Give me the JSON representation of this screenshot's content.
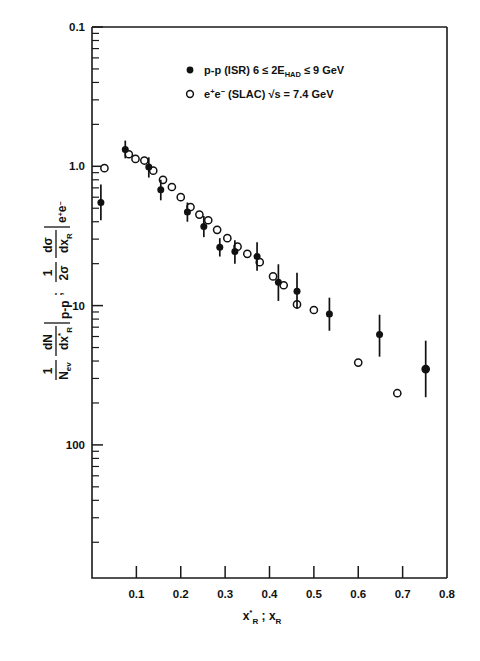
{
  "figure": {
    "background": "#ffffff",
    "ink_color": "#111111"
  },
  "chart_data": {
    "type": "scatter",
    "title": "",
    "xlabel": "x*R ; xR",
    "ylabel": "1/Nev dN/dx*R |p-p ; 1/2sigma dsigma/dxR |e+e-",
    "xscale": "linear",
    "yscale": "log",
    "xlim": [
      0.0,
      0.8
    ],
    "ylim": [
      0.1,
      100
    ],
    "xticks": [
      0.1,
      0.2,
      0.3,
      0.4,
      0.5,
      0.6,
      0.7,
      0.8
    ],
    "xticklabels": [
      "0.1",
      "0.2",
      "0.3",
      "0.4",
      "0.5",
      "0.6",
      "0.7",
      "0.8"
    ],
    "yticks": [
      0.1,
      1.0,
      10,
      100
    ],
    "yticklabels": [
      "0.1",
      "1.0",
      "10",
      "100"
    ],
    "grid": false,
    "legend_position": "top-center",
    "series": [
      {
        "name": "p-p (ISR)  6 <= 2E_HAD <= 9 GeV",
        "marker": "filled-circle",
        "points": [
          {
            "x": 0.02,
            "y": 5.5,
            "yerr_lo": 4.1,
            "yerr_hi": 7.4
          },
          {
            "x": 0.075,
            "y": 13.2,
            "yerr_lo": 11.4,
            "yerr_hi": 15.3
          },
          {
            "x": 0.128,
            "y": 9.9,
            "yerr_lo": 8.3,
            "yerr_hi": 11.6
          },
          {
            "x": 0.155,
            "y": 6.8,
            "yerr_lo": 5.7,
            "yerr_hi": 8.0
          },
          {
            "x": 0.215,
            "y": 4.7,
            "yerr_lo": 4.0,
            "yerr_hi": 5.5
          },
          {
            "x": 0.252,
            "y": 3.7,
            "yerr_lo": 3.1,
            "yerr_hi": 4.4
          },
          {
            "x": 0.288,
            "y": 2.62,
            "yerr_lo": 2.25,
            "yerr_hi": 3.05
          },
          {
            "x": 0.322,
            "y": 2.45,
            "yerr_lo": 2.0,
            "yerr_hi": 2.95
          },
          {
            "x": 0.372,
            "y": 2.25,
            "yerr_lo": 1.78,
            "yerr_hi": 2.85
          },
          {
            "x": 0.42,
            "y": 1.47,
            "yerr_lo": 1.08,
            "yerr_hi": 1.98
          },
          {
            "x": 0.462,
            "y": 1.27,
            "yerr_lo": 0.95,
            "yerr_hi": 1.72
          },
          {
            "x": 0.535,
            "y": 0.87,
            "yerr_lo": 0.66,
            "yerr_hi": 1.14
          },
          {
            "x": 0.648,
            "y": 0.62,
            "yerr_lo": 0.43,
            "yerr_hi": 0.86
          },
          {
            "x": 0.752,
            "y": 0.35,
            "yerr_lo": 0.22,
            "yerr_hi": 0.56
          }
        ]
      },
      {
        "name": "e+e- (SLAC)  sqrt(s) = 7.4 GeV",
        "marker": "open-circle",
        "points": [
          {
            "x": 0.028,
            "y": 9.7
          },
          {
            "x": 0.083,
            "y": 12.2
          },
          {
            "x": 0.098,
            "y": 11.3
          },
          {
            "x": 0.118,
            "y": 11.0
          },
          {
            "x": 0.138,
            "y": 9.3
          },
          {
            "x": 0.16,
            "y": 8.0
          },
          {
            "x": 0.18,
            "y": 7.1
          },
          {
            "x": 0.2,
            "y": 6.0
          },
          {
            "x": 0.222,
            "y": 5.1
          },
          {
            "x": 0.242,
            "y": 4.5
          },
          {
            "x": 0.262,
            "y": 4.1
          },
          {
            "x": 0.282,
            "y": 3.5
          },
          {
            "x": 0.305,
            "y": 3.05
          },
          {
            "x": 0.328,
            "y": 2.65
          },
          {
            "x": 0.35,
            "y": 2.35
          },
          {
            "x": 0.378,
            "y": 2.05
          },
          {
            "x": 0.408,
            "y": 1.62
          },
          {
            "x": 0.432,
            "y": 1.4
          },
          {
            "x": 0.462,
            "y": 1.02
          },
          {
            "x": 0.5,
            "y": 0.93
          },
          {
            "x": 0.6,
            "y": 0.39
          },
          {
            "x": 0.688,
            "y": 0.235
          },
          {
            "x": 0.752,
            "y": 0.35
          }
        ]
      }
    ]
  },
  "legend": {
    "entry1": {
      "marker": "filled-circle",
      "label_main": "p-p  (ISR)",
      "label_cond_pre": "6 ≤ 2E",
      "label_cond_sub": "HAD",
      "label_cond_post": "≤ 9 GeV"
    },
    "entry2": {
      "marker": "open-circle",
      "label_main_a": "e",
      "label_main_a_sup": "+",
      "label_main_b": "e",
      "label_main_b_sup": "−",
      "label_main_c": "(SLAC)",
      "label_cond": "√s = 7.4 GeV"
    }
  },
  "axes": {
    "x": {
      "title_part1": "x",
      "title_part1_sup": "*",
      "title_part1_sub": "R",
      "title_sep": ";",
      "title_part2": "x",
      "title_part2_sub": "R",
      "ticklabels": [
        "0.1",
        "0.2",
        "0.3",
        "0.4",
        "0.5",
        "0.6",
        "0.7",
        "0.8"
      ]
    },
    "y": {
      "ticklabels": [
        "100",
        "10",
        "1.0",
        "0.1"
      ],
      "title_left_num": "1",
      "title_left_den": "N",
      "title_left_den_sub": "ev",
      "title_left_frac_num": "dN",
      "title_left_frac_den": "dx",
      "title_left_frac_den_sup": "*",
      "title_left_frac_den_sub": "R",
      "title_left_subscript": "p-p",
      "title_separator": ";",
      "title_right_num": "1",
      "title_right_den": "2σ",
      "title_right_frac_num": "dσ",
      "title_right_frac_den": "dx",
      "title_right_frac_den_sub": "R",
      "title_right_subscript_a": "e",
      "title_right_subscript_a_sup": "+",
      "title_right_subscript_b": "e",
      "title_right_subscript_b_sup": "−"
    }
  }
}
